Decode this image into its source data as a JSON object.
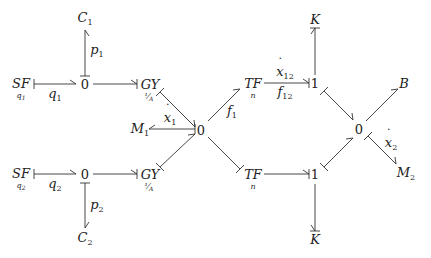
{
  "diagram": {
    "type": "bond-graph",
    "nodes": {
      "C1": {
        "label": "C",
        "sub": "1"
      },
      "C2": {
        "label": "C",
        "sub": "2"
      },
      "SF1": {
        "label": "SF",
        "under": "q1"
      },
      "SF2": {
        "label": "SF",
        "under": "q2"
      },
      "J0a": {
        "label": "0"
      },
      "J0b": {
        "label": "0"
      },
      "GY1": {
        "label": "GY",
        "under": "1/A"
      },
      "GY2": {
        "label": "GY",
        "under": "1/A"
      },
      "M1": {
        "label": "M",
        "sub": "1"
      },
      "J0c": {
        "label": "0"
      },
      "TF1": {
        "label": "TF",
        "under": "n"
      },
      "TF2": {
        "label": "TF",
        "under": "n"
      },
      "J1a": {
        "label": "1"
      },
      "J1b": {
        "label": "1"
      },
      "K1": {
        "label": "K"
      },
      "K2": {
        "label": "K"
      },
      "J0d": {
        "label": "0"
      },
      "B": {
        "label": "B"
      },
      "M2": {
        "label": "M",
        "sub": "2"
      }
    },
    "bond_labels": {
      "q1": {
        "label": "q",
        "sub": "1"
      },
      "q2": {
        "label": "q",
        "sub": "2"
      },
      "p1": {
        "label": "p",
        "sub": "1"
      },
      "p2": {
        "label": "p",
        "sub": "2"
      },
      "x1dot": {
        "label": "x",
        "sub": "1"
      },
      "f1": {
        "label": "f",
        "sub": "1"
      },
      "x12dot": {
        "label": "x",
        "sub": "12"
      },
      "f12": {
        "label": "f",
        "sub": "12"
      },
      "x2dot": {
        "label": "x",
        "sub": "2"
      }
    }
  }
}
